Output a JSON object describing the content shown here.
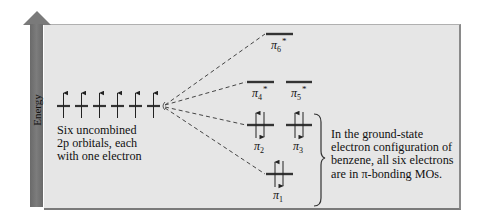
{
  "axis": {
    "label": "Energy",
    "direction": "up"
  },
  "atomic_orbitals": {
    "count": 6,
    "electrons_each": 1,
    "caption_lines": [
      "Six uncombined",
      "2p orbitals, each",
      "with one electron"
    ]
  },
  "molecular_orbitals": [
    {
      "id": "pi1",
      "symbol": "π",
      "sub": "1",
      "star": "",
      "type": "bonding",
      "electrons": 2
    },
    {
      "id": "pi2",
      "symbol": "π",
      "sub": "2",
      "star": "",
      "type": "bonding",
      "electrons": 2
    },
    {
      "id": "pi3",
      "symbol": "π",
      "sub": "3",
      "star": "",
      "type": "bonding",
      "electrons": 2
    },
    {
      "id": "pi4",
      "symbol": "π",
      "sub": "4",
      "star": "*",
      "type": "antibonding",
      "electrons": 0
    },
    {
      "id": "pi5",
      "symbol": "π",
      "sub": "5",
      "star": "*",
      "type": "antibonding",
      "electrons": 0
    },
    {
      "id": "pi6",
      "symbol": "π",
      "sub": "6",
      "star": "*",
      "type": "antibonding",
      "electrons": 0
    }
  ],
  "bracket_caption_lines": [
    "In the ground-state",
    "electron configuration of",
    "benzene, all six electrons",
    "are in π-bonding MOs."
  ],
  "colors": {
    "panel": "#e6e6e6",
    "arrow": "#767676",
    "line": "#333333"
  }
}
